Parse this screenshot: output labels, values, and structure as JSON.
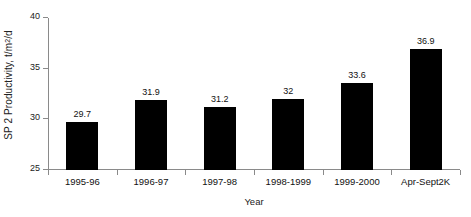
{
  "chart_data": {
    "type": "bar",
    "title": "",
    "xlabel": "Year",
    "ylabel": "SP 2 Productivity, t/m",
    "ylabel_sup": "2",
    "ylabel_tail": "/d",
    "ylabel_full": "SP 2 Productivity, t/m2/d",
    "categories": [
      "1995-96",
      "1996-97",
      "1997-98",
      "1998-1999",
      "1999-2000",
      "Apr-Sept2K"
    ],
    "values": [
      29.7,
      31.9,
      31.2,
      32,
      33.6,
      36.9
    ],
    "value_labels": [
      "29.7",
      "31.9",
      "31.2",
      "32",
      "33.6",
      "36.9"
    ],
    "ylim": [
      25,
      40
    ],
    "yticks": [
      25,
      30,
      35,
      40
    ],
    "ytick_labels": [
      "25",
      "30",
      "35",
      "40"
    ],
    "grid": false,
    "legend": false,
    "bar_color": "#000000",
    "axis_color": "#8a8a8a",
    "background": "#ffffff"
  }
}
